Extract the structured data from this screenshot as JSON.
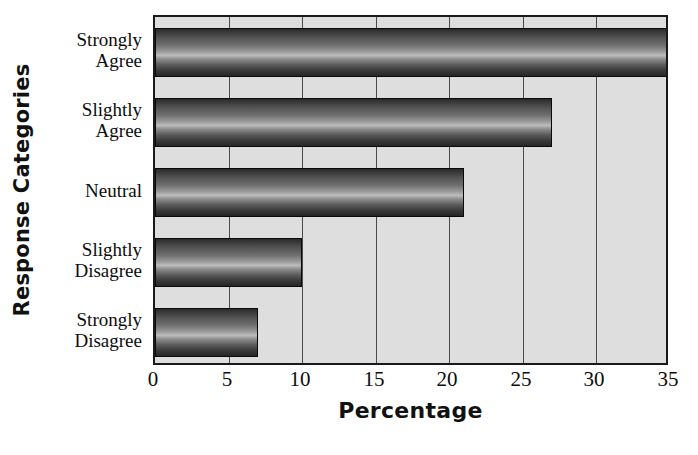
{
  "chart_data": {
    "type": "bar",
    "orientation": "horizontal",
    "title": "",
    "xlabel": "Percentage",
    "ylabel": "Response Categories",
    "categories": [
      "Strongly\nAgree",
      "Slightly\nAgree",
      "Neutral",
      "Slightly\nDisagree",
      "Strongly\nDisagree"
    ],
    "values": [
      35,
      27,
      21,
      10,
      7
    ],
    "xlim": [
      0,
      35
    ],
    "xticks": [
      0,
      5,
      10,
      15,
      20,
      25,
      30,
      35
    ],
    "xtick_labels": [
      "0",
      "5",
      "10",
      "15",
      "20",
      "25",
      "30",
      "35"
    ],
    "grid": "vertical",
    "legend": "none",
    "colors": {
      "plot_background": "#dedede",
      "bar_dark": "#262626",
      "bar_highlight": "#bdbdbd",
      "axis_line": "#1a1a1a",
      "gridline": "#4a4a4a",
      "text": "#0d0d0d",
      "page_background": "#ffffff"
    }
  }
}
